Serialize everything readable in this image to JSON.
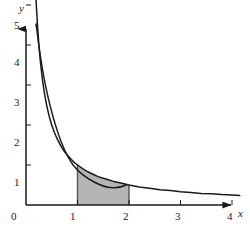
{
  "figure": {
    "title": "",
    "background_color": "#ffffff",
    "axis_color": "#1a1a1a",
    "curve_color": "#1a1a1a",
    "shade_color": "#b5b5b5",
    "shade_edge_color": "#555555"
  },
  "axes": {
    "x_label": "x",
    "y_label": "y",
    "x_ticks": [
      "0",
      "1",
      "2",
      "3",
      "4"
    ],
    "y_ticks": [
      "1",
      "2",
      "3",
      "4",
      "5"
    ],
    "x_tick_values": [
      0,
      1,
      2,
      3,
      4
    ],
    "y_tick_values": [
      1,
      2,
      3,
      4,
      5
    ],
    "x_arrow": true,
    "y_arrow": true
  },
  "chart_data": {
    "type": "line",
    "title": "",
    "xlabel": "x",
    "ylabel": "y",
    "xlim": [
      0,
      4.25
    ],
    "ylim": [
      0,
      5.3
    ],
    "grid": false,
    "legend": "none",
    "function": "y = 1/x",
    "series": [
      {
        "name": "y = 1/x",
        "x": [
          0.195,
          0.22,
          0.25,
          0.28,
          0.32,
          0.36,
          0.4,
          0.45,
          0.5,
          0.55,
          0.6,
          0.65,
          0.7,
          0.75,
          0.8,
          0.85,
          0.9,
          0.95,
          1.0,
          1.1,
          1.2,
          1.3,
          1.4,
          1.5,
          1.6,
          1.7,
          1.8,
          1.9,
          2.0,
          2.2,
          2.4,
          2.6,
          2.8,
          3.0,
          3.2,
          3.4,
          3.6,
          3.8,
          4.0,
          4.15
        ],
        "y": [
          5.13,
          4.55,
          4.0,
          3.57,
          3.13,
          2.78,
          2.5,
          2.22,
          2.0,
          1.82,
          1.67,
          1.54,
          1.43,
          1.33,
          1.25,
          1.18,
          1.11,
          1.05,
          1.0,
          0.91,
          0.83,
          0.77,
          0.71,
          0.67,
          0.63,
          0.59,
          0.56,
          0.53,
          0.5,
          0.45,
          0.42,
          0.38,
          0.36,
          0.33,
          0.31,
          0.29,
          0.28,
          0.26,
          0.25,
          0.24
        ]
      }
    ],
    "shaded_region": {
      "label": "",
      "x_start": 1,
      "x_end": 2,
      "y_at_start": 1.0,
      "y_at_end": 0.5,
      "under_curve": true,
      "fill": "#b5b5b5"
    },
    "annotations": []
  }
}
